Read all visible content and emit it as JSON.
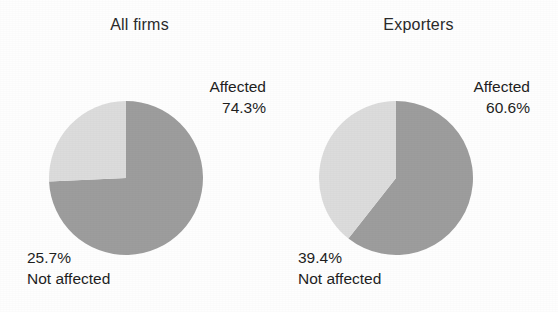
{
  "chart_data": [
    {
      "type": "pie",
      "title": "All firms",
      "categories": [
        "Affected",
        "Not affected"
      ],
      "values": [
        74.3,
        25.7
      ],
      "labels": [
        "74.3%",
        "25.7%"
      ],
      "colors": [
        "#9d9d9d",
        "#dcdcdc"
      ],
      "start_angle_deg": 0,
      "direction": "clockwise",
      "legend": "none",
      "grid": false,
      "annotations": [
        {
          "name": "Affected",
          "value": "74.3%",
          "position": "upper-right"
        },
        {
          "name": "Not affected",
          "value": "25.7%",
          "position": "lower-left"
        }
      ]
    },
    {
      "type": "pie",
      "title": "Exporters",
      "categories": [
        "Affected",
        "Not affected"
      ],
      "values": [
        60.6,
        39.4
      ],
      "labels": [
        "60.6%",
        "39.4%"
      ],
      "colors": [
        "#9d9d9d",
        "#dcdcdc"
      ],
      "start_angle_deg": 0,
      "direction": "clockwise",
      "legend": "none",
      "grid": false,
      "annotations": [
        {
          "name": "Affected",
          "value": "60.6%",
          "position": "upper-right"
        },
        {
          "name": "Not affected",
          "value": "39.4%",
          "position": "lower-left"
        }
      ]
    }
  ],
  "panels": {
    "left": {
      "title": "All firms",
      "affected_label": "Affected",
      "affected_pct": "74.3%",
      "not_affected_label": "Not affected",
      "not_affected_pct": "25.7%"
    },
    "right": {
      "title": "Exporters",
      "affected_label": "Affected",
      "affected_pct": "60.6%",
      "not_affected_label": "Not affected",
      "not_affected_pct": "39.4%"
    }
  },
  "colors": {
    "affected_slice": "#9d9d9d",
    "not_affected_slice": "#dcdcdc",
    "text": "#1f1f1f",
    "background": "#fefefe"
  }
}
